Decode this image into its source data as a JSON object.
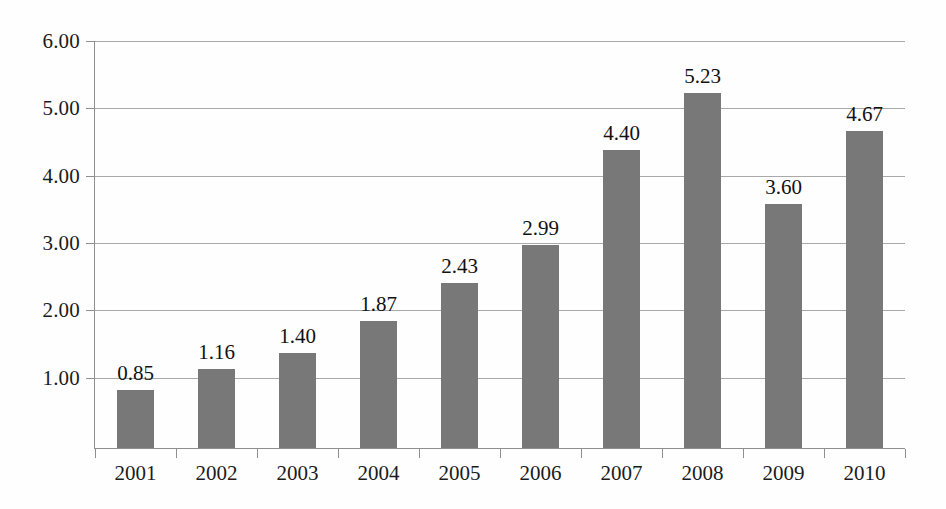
{
  "chart_data": {
    "type": "bar",
    "title": "",
    "subtitle": "",
    "xlabel": "",
    "ylabel": "",
    "categories": [
      "2001",
      "2002",
      "2003",
      "2004",
      "2005",
      "2006",
      "2007",
      "2008",
      "2009",
      "2010"
    ],
    "values": [
      0.85,
      1.16,
      1.4,
      1.87,
      2.43,
      2.99,
      4.4,
      5.23,
      3.6,
      4.67
    ],
    "value_labels": [
      "0.85",
      "1.16",
      "1.40",
      "1.87",
      "2.43",
      "2.99",
      "4.40",
      "5.23",
      "3.60",
      "4.67"
    ],
    "ylim": [
      0,
      6
    ],
    "ytick_values": [
      1,
      2,
      3,
      4,
      5,
      6
    ],
    "ytick_labels": [
      "1.00",
      "2.00",
      "3.00",
      "4.00",
      "5.00",
      "6.00"
    ],
    "grid": true,
    "grid_axis": "y",
    "legend": false,
    "legend_position": "none",
    "data_labels_shown": true,
    "bar_color": "#787878",
    "grid_color": "#9a9a9a",
    "axis_color": "#8f8f8f",
    "background_color": "#ffffff",
    "text_color": "#1b1b1b"
  }
}
